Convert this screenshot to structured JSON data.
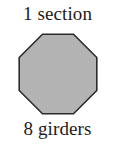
{
  "figure": {
    "background_color": "#ffffff",
    "top_label": "1 section",
    "bottom_label": "8 girders"
  },
  "shape": {
    "name": "octagon",
    "sides": 8,
    "fill_color": "#b3b3b3",
    "stroke_color": "#2b2b2b",
    "stroke_width": 1.6
  }
}
